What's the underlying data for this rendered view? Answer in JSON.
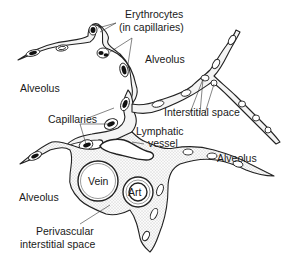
{
  "diagram": {
    "type": "histology-schematic",
    "labels": {
      "erythrocytes_line1": "Erythrocytes",
      "erythrocytes_line2": "(in capillaries)",
      "alveolus_top_center": "Alveolus",
      "alveolus_left": "Alveolus",
      "interstitial_space": "Interstitial space",
      "capillaries": "Capillaries",
      "lymphatic_line1": "Lymphatic",
      "lymphatic_line2": "vessel",
      "alveolus_right": "Alveolus",
      "vein": "Vein",
      "art": "Art",
      "alveolus_bottom_left": "Alveolus",
      "perivascular_line1": "Perivascular",
      "perivascular_line2": "interstitial space"
    },
    "colors": {
      "ink": "#1a1a1a",
      "background": "#ffffff",
      "stipple": "#9a9a9a"
    }
  }
}
